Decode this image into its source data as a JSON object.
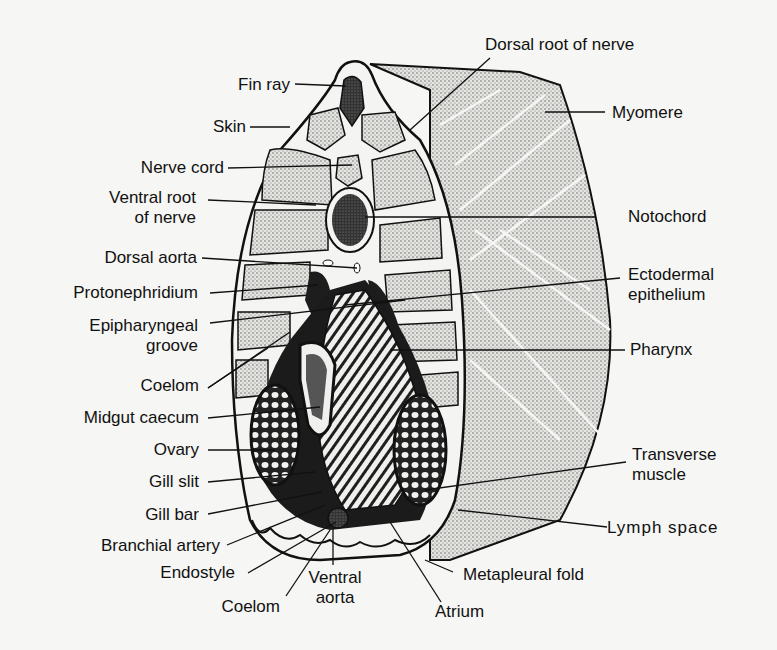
{
  "diagram": {
    "labels_left": [
      {
        "id": "fin-ray",
        "text": "Fin ray"
      },
      {
        "id": "skin",
        "text": "Skin"
      },
      {
        "id": "nerve-cord",
        "text": "Nerve cord"
      },
      {
        "id": "ventral-root",
        "line1": "Ventral root",
        "line2": "of nerve"
      },
      {
        "id": "dorsal-aorta",
        "text": "Dorsal aorta"
      },
      {
        "id": "protonephridium",
        "text": "Protonephridium"
      },
      {
        "id": "epipharyngeal-groove",
        "line1": "Epipharyngeal",
        "line2": "groove"
      },
      {
        "id": "coelom-upper",
        "text": "Coelom"
      },
      {
        "id": "midgut-caecum",
        "text": "Midgut caecum"
      },
      {
        "id": "ovary",
        "text": "Ovary"
      },
      {
        "id": "gill-slit",
        "text": "Gill slit"
      },
      {
        "id": "gill-bar",
        "text": "Gill bar"
      },
      {
        "id": "branchial-artery",
        "text": "Branchial artery"
      },
      {
        "id": "endostyle",
        "text": "Endostyle"
      },
      {
        "id": "coelom-lower",
        "text": "Coelom"
      }
    ],
    "labels_bottom": [
      {
        "id": "ventral-aorta",
        "line1": "Ventral",
        "line2": "aorta"
      },
      {
        "id": "atrium",
        "text": "Atrium"
      },
      {
        "id": "metapleural-fold",
        "text": "Metapleural fold"
      }
    ],
    "labels_right": [
      {
        "id": "dorsal-root",
        "text": "Dorsal root of nerve"
      },
      {
        "id": "myomere",
        "text": "Myomere"
      },
      {
        "id": "notochord",
        "text": "Notochord"
      },
      {
        "id": "ectodermal-epithelium",
        "line1": "Ectodermal",
        "line2": "epithelium"
      },
      {
        "id": "pharynx",
        "text": "Pharynx"
      },
      {
        "id": "transverse-muscle",
        "line1": "Transverse",
        "line2": "muscle"
      },
      {
        "id": "lymph-space",
        "text": "Lymph  space"
      }
    ],
    "colors": {
      "ink": "#111111",
      "paper": "#f6f6f4",
      "stipple": "#c9c9c6",
      "dark_tissue": "#2a2a2a"
    }
  }
}
